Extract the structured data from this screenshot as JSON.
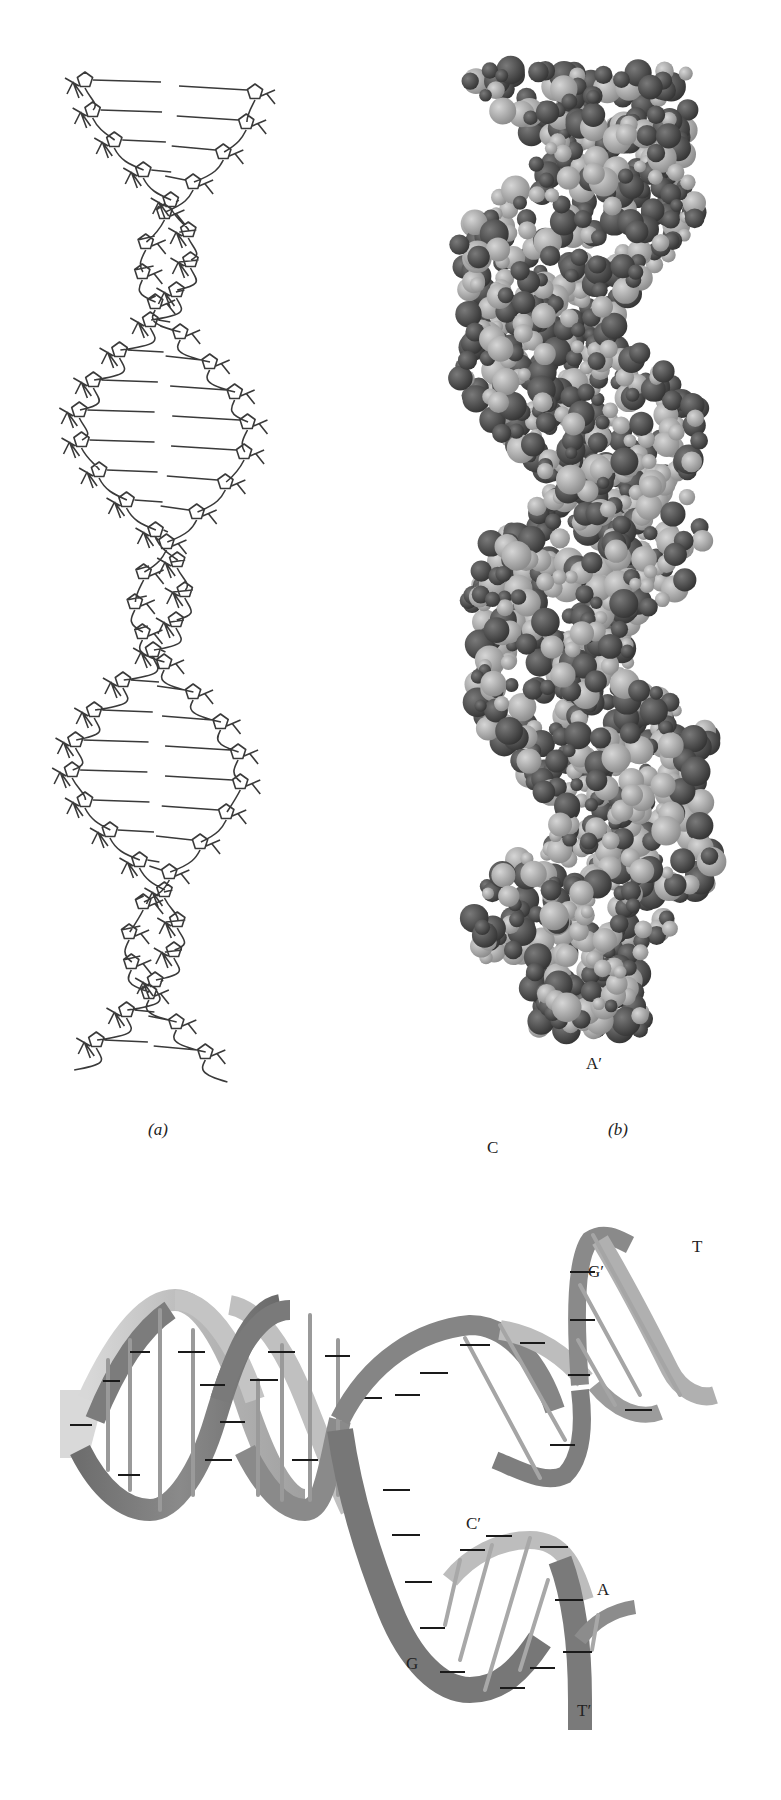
{
  "figure": {
    "panels": [
      {
        "id": "a",
        "caption": "(a)",
        "description": "stick (wireframe) model of B-DNA double helix"
      },
      {
        "id": "b",
        "caption": "(b)",
        "description": "space-filling model of B-DNA double helix"
      },
      {
        "id": "c",
        "caption": "",
        "description": "ribbon diagram of DNA strands separating during replication"
      }
    ],
    "ribbon_labels": {
      "a_prime": "A′",
      "t": "T",
      "c": "C",
      "g_prime": "G′",
      "c_prime": "C′",
      "a": "A",
      "g": "G",
      "t_prime": "T′"
    },
    "colors": {
      "stick": "#3a3a3a",
      "atom_dark": "#4a4a4a",
      "atom_light": "#b5b5b5",
      "ribbon_dark": "#7a7a7a",
      "ribbon_light": "#c8c8c8",
      "rung": "#9a9a9a"
    }
  }
}
